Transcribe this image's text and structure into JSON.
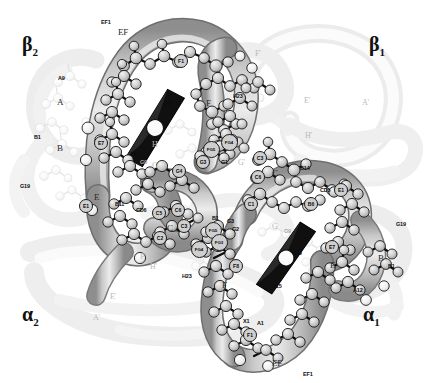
{
  "figure": {
    "kind": "molecular-structure-diagram",
    "molecule": "hemoglobin tetramer",
    "representation": "ribbon backbone with ball-and-stick residues and heme groups",
    "color_mode": "grayscale",
    "colors": {
      "background": "#ffffff",
      "ribbon_light": "#e2e2e2",
      "ribbon_mid": "#b9b9b9",
      "ribbon_dark": "#8d8d8d",
      "ribbon_outline": "#6f6f6f",
      "ghost_ribbon": "#f0f0f0",
      "ghost_outline": "#e0e0e0",
      "atom_fill": "#cfcfcf",
      "atom_fill_light": "#ededed",
      "atom_outline": "#1b1b1b",
      "bond": "#0d0d0d",
      "heme_dark": "#101010",
      "label_dark": "#0a0a0a",
      "label_ghost": "#b9b9b9"
    }
  },
  "subunits": [
    {
      "name": "subunit-beta2",
      "text": "β",
      "sub": "2",
      "x": 22,
      "y": 33
    },
    {
      "name": "subunit-beta1",
      "text": "β",
      "sub": "1",
      "x": 369,
      "y": 33
    },
    {
      "name": "subunit-alpha2",
      "text": "α",
      "sub": "2",
      "x": 22,
      "y": 303
    },
    {
      "name": "subunit-alpha1",
      "text": "α",
      "sub": "1",
      "x": 363,
      "y": 303
    }
  ],
  "heme_groups": [
    {
      "name": "heme-beta2",
      "cx": 155,
      "cy": 128,
      "angle": -62
    },
    {
      "name": "heme-alpha1",
      "cx": 286,
      "cy": 258,
      "angle": -58
    }
  ],
  "residue_labels": [
    {
      "text": "EF1",
      "x": 101,
      "y": 19,
      "style": "small"
    },
    {
      "text": "EF",
      "x": 118,
      "y": 27,
      "style": "big"
    },
    {
      "text": "F1",
      "x": 180,
      "y": 60,
      "style": "chip"
    },
    {
      "text": "A9",
      "x": 58,
      "y": 75,
      "style": "small"
    },
    {
      "text": "A",
      "x": 57,
      "y": 97,
      "style": "big"
    },
    {
      "text": "H15",
      "x": 163,
      "y": 101,
      "style": "small"
    },
    {
      "text": "F",
      "x": 206,
      "y": 98,
      "style": "big"
    },
    {
      "text": "H23",
      "x": 233,
      "y": 93,
      "style": "small"
    },
    {
      "text": "B1",
      "x": 34,
      "y": 134,
      "style": "small"
    },
    {
      "text": "B",
      "x": 57,
      "y": 143,
      "style": "big"
    },
    {
      "text": "E7",
      "x": 100,
      "y": 142,
      "style": "chip"
    },
    {
      "text": "H",
      "x": 152,
      "y": 140,
      "style": "ghost"
    },
    {
      "text": "H9",
      "x": 131,
      "y": 151,
      "style": "small"
    },
    {
      "text": "G9",
      "x": 140,
      "y": 159,
      "style": "ghost-small"
    },
    {
      "text": "G",
      "x": 152,
      "y": 161,
      "style": "ghost"
    },
    {
      "text": "FG4",
      "x": 228,
      "y": 141,
      "style": "chip"
    },
    {
      "text": "FG5",
      "x": 210,
      "y": 148,
      "style": "chip"
    },
    {
      "text": "G1",
      "x": 221,
      "y": 159,
      "style": "small"
    },
    {
      "text": "G'",
      "x": 238,
      "y": 158,
      "style": "ghost"
    },
    {
      "text": "C3",
      "x": 259,
      "y": 157,
      "style": "chip"
    },
    {
      "text": "C6",
      "x": 257,
      "y": 176,
      "style": "chip"
    },
    {
      "text": "C",
      "x": 272,
      "y": 168,
      "style": "big"
    },
    {
      "text": "B14",
      "x": 300,
      "y": 165,
      "style": "small"
    },
    {
      "text": "G19",
      "x": 20,
      "y": 183,
      "style": "small"
    },
    {
      "text": "G4",
      "x": 178,
      "y": 170,
      "style": "chip"
    },
    {
      "text": "G3",
      "x": 202,
      "y": 161,
      "style": "chip"
    },
    {
      "text": "CD5",
      "x": 320,
      "y": 187,
      "style": "small"
    },
    {
      "text": "E1",
      "x": 340,
      "y": 189,
      "style": "chip"
    },
    {
      "text": "E",
      "x": 94,
      "y": 192,
      "style": "big"
    },
    {
      "text": "E1",
      "x": 85,
      "y": 205,
      "style": "chip"
    },
    {
      "text": "B11",
      "x": 115,
      "y": 201,
      "style": "small"
    },
    {
      "text": "CD6",
      "x": 136,
      "y": 207,
      "style": "small"
    },
    {
      "text": "C5",
      "x": 158,
      "y": 212,
      "style": "chip"
    },
    {
      "text": "C6",
      "x": 177,
      "y": 209,
      "style": "chip"
    },
    {
      "text": "C",
      "x": 167,
      "y": 223,
      "style": "big"
    },
    {
      "text": "C3",
      "x": 183,
      "y": 225,
      "style": "chip"
    },
    {
      "text": "C2",
      "x": 159,
      "y": 237,
      "style": "chip"
    },
    {
      "text": "C1",
      "x": 250,
      "y": 203,
      "style": "chip"
    },
    {
      "text": "B6",
      "x": 310,
      "y": 203,
      "style": "chip"
    },
    {
      "text": "G3",
      "x": 227,
      "y": 218,
      "style": "small"
    },
    {
      "text": "B1",
      "x": 212,
      "y": 215,
      "style": "small"
    },
    {
      "text": "G2",
      "x": 232,
      "y": 226,
      "style": "small"
    },
    {
      "text": "FG5",
      "x": 212,
      "y": 229,
      "style": "chip"
    },
    {
      "text": "FG3",
      "x": 218,
      "y": 241,
      "style": "chip"
    },
    {
      "text": "G",
      "x": 272,
      "y": 222,
      "style": "ghost"
    },
    {
      "text": "G9",
      "x": 284,
      "y": 228,
      "style": "ghost-small"
    },
    {
      "text": "F'",
      "x": 140,
      "y": 252,
      "style": "ghost"
    },
    {
      "text": "FG4",
      "x": 198,
      "y": 248,
      "style": "chip"
    },
    {
      "text": "E7",
      "x": 331,
      "y": 246,
      "style": "chip"
    },
    {
      "text": "E",
      "x": 330,
      "y": 260,
      "style": "big"
    },
    {
      "text": "G19",
      "x": 396,
      "y": 221,
      "style": "small"
    },
    {
      "text": "B",
      "x": 378,
      "y": 253,
      "style": "big"
    },
    {
      "text": "B1",
      "x": 388,
      "y": 263,
      "style": "small"
    },
    {
      "text": "H23",
      "x": 182,
      "y": 273,
      "style": "small"
    },
    {
      "text": "H9",
      "x": 295,
      "y": 250,
      "style": "small"
    },
    {
      "text": "H15",
      "x": 272,
      "y": 283,
      "style": "small"
    },
    {
      "text": "H'",
      "x": 150,
      "y": 262,
      "style": "ghost"
    },
    {
      "text": "F8",
      "x": 235,
      "y": 265,
      "style": "chip"
    },
    {
      "text": "F",
      "x": 222,
      "y": 280,
      "style": "big"
    },
    {
      "text": "A12",
      "x": 353,
      "y": 287,
      "style": "small"
    },
    {
      "text": "E'",
      "x": 110,
      "y": 292,
      "style": "ghost"
    },
    {
      "text": "A'",
      "x": 93,
      "y": 313,
      "style": "ghost"
    },
    {
      "text": "A1",
      "x": 257,
      "y": 320,
      "style": "small"
    },
    {
      "text": "F1",
      "x": 249,
      "y": 334,
      "style": "chip"
    },
    {
      "text": "X1",
      "x": 243,
      "y": 318,
      "style": "small"
    },
    {
      "text": "EF",
      "x": 272,
      "y": 358,
      "style": "big"
    },
    {
      "text": "EF1",
      "x": 303,
      "y": 371,
      "style": "small"
    },
    {
      "text": "E'",
      "x": 304,
      "y": 96,
      "style": "ghost"
    },
    {
      "text": "A'",
      "x": 362,
      "y": 98,
      "style": "ghost"
    },
    {
      "text": "H'",
      "x": 305,
      "y": 131,
      "style": "ghost"
    },
    {
      "text": "F'",
      "x": 255,
      "y": 49,
      "style": "ghost"
    }
  ]
}
